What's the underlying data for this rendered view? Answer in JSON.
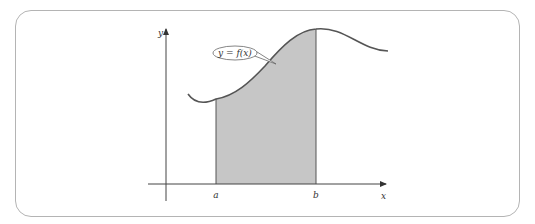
{
  "figure": {
    "type": "definite-integral-area-diagram",
    "axis_labels": {
      "x": "x",
      "y": "y"
    },
    "bounds": {
      "lower": "a",
      "upper": "b"
    },
    "curve_label": "y = f(x)",
    "colors": {
      "frame": "#b4b4b4",
      "curve": "#555555",
      "axes": "#444444",
      "shaded_area": "#c6c6c6",
      "text": "#333333"
    }
  }
}
